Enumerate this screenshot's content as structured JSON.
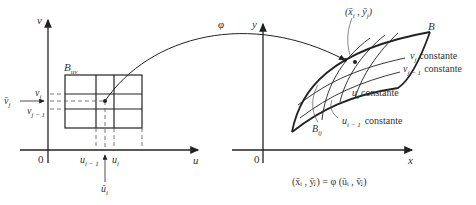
{
  "diagram": {
    "left_panel": {
      "axis_v_label": "v",
      "axis_u_label": "u",
      "origin_label": "0",
      "region_label": "B",
      "region_subscript": "uv",
      "v_labels": [
        {
          "base": "v",
          "sub": "j"
        },
        {
          "base": "v",
          "sub": "j − 1"
        },
        {
          "base": "v̄",
          "sub": "j"
        }
      ],
      "u_labels": [
        {
          "base": "u",
          "sub": "i − 1"
        },
        {
          "base": "u",
          "sub": "i"
        },
        {
          "base": "ū",
          "sub": "i"
        }
      ]
    },
    "mapping_label": "φ",
    "right_panel": {
      "axis_y_label": "y",
      "axis_x_label": "x",
      "origin_label": "0",
      "region_label": "B",
      "cell_label": "B",
      "cell_subscript": "ij",
      "point_label": "(x̄ , ȳ )",
      "point_subs": [
        "i",
        "j"
      ],
      "curve_labels": [
        {
          "base": "v",
          "sub": "j",
          "text": "constante"
        },
        {
          "base": "v",
          "sub": "j − 1",
          "text": "constante"
        },
        {
          "base": "u",
          "sub": "i",
          "text": "constante"
        },
        {
          "base": "u",
          "sub": "i − 1",
          "text": "constante"
        }
      ],
      "equation": "(x̄ᵢ , ȳⱼ) = φ (ūᵢ , v̄ⱼ)"
    },
    "colors": {
      "ink": "#222222",
      "dashed": "#555555"
    }
  }
}
